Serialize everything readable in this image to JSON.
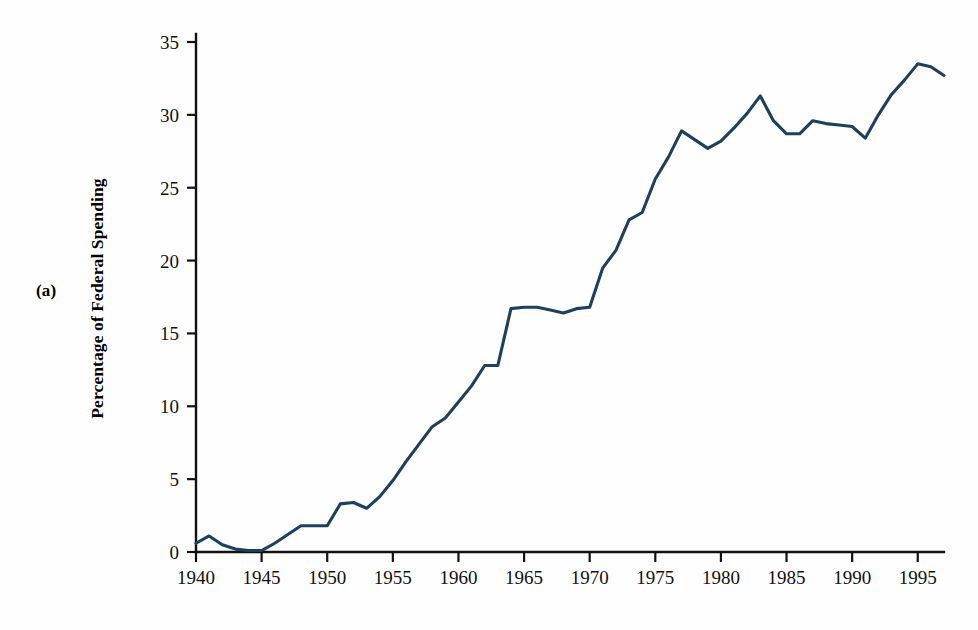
{
  "figure": {
    "panel_label": "(a)",
    "ylabel": "Percentage of Federal Spending",
    "line_color": "#1d4061",
    "axis_color": "#111111",
    "background": "#fefefe"
  },
  "chart_data": {
    "type": "line",
    "title": "",
    "subtitle": "",
    "xlabel": "",
    "ylabel": "Percentage of Federal Spending",
    "xlim": [
      1940,
      1997
    ],
    "ylim": [
      0,
      35
    ],
    "xticks": [
      1940,
      1945,
      1950,
      1955,
      1960,
      1965,
      1970,
      1975,
      1980,
      1985,
      1990,
      1995
    ],
    "xtick_labels": [
      "1940",
      "1945",
      "1950",
      "1955",
      "1960",
      "1965",
      "1970",
      "1975",
      "1980",
      "1985",
      "1990",
      "1995"
    ],
    "yticks": [
      0,
      5,
      10,
      15,
      20,
      25,
      30,
      35
    ],
    "ytick_labels": [
      "0",
      "5",
      "10",
      "15",
      "20",
      "25",
      "30",
      "35"
    ],
    "grid": false,
    "legend": null,
    "legend_position": "none",
    "annotations": [
      "(a)"
    ],
    "x": [
      1940,
      1941,
      1942,
      1943,
      1944,
      1945,
      1946,
      1947,
      1948,
      1949,
      1950,
      1951,
      1952,
      1953,
      1954,
      1955,
      1956,
      1957,
      1958,
      1959,
      1960,
      1961,
      1962,
      1963,
      1964,
      1965,
      1966,
      1967,
      1968,
      1969,
      1970,
      1971,
      1972,
      1973,
      1974,
      1975,
      1976,
      1977,
      1978,
      1979,
      1980,
      1981,
      1982,
      1983,
      1984,
      1985,
      1986,
      1987,
      1988,
      1989,
      1990,
      1991,
      1992,
      1993,
      1994,
      1995,
      1996,
      1997
    ],
    "y": [
      0.6,
      1.1,
      0.5,
      0.2,
      0.1,
      0.1,
      0.6,
      1.2,
      1.8,
      1.8,
      1.8,
      3.3,
      3.4,
      3.0,
      3.8,
      4.9,
      6.2,
      7.4,
      8.6,
      9.2,
      10.3,
      11.4,
      12.8,
      12.8,
      16.7,
      16.8,
      16.8,
      16.6,
      16.4,
      16.7,
      16.8,
      19.5,
      20.7,
      22.8,
      23.3,
      25.6,
      27.1,
      28.9,
      28.3,
      27.7,
      28.2,
      29.1,
      30.1,
      31.3,
      29.6,
      28.7,
      28.7,
      29.6,
      29.4,
      29.3,
      29.2,
      28.4,
      30.0,
      31.4,
      32.4,
      33.5,
      33.3,
      32.7
    ],
    "series": [
      {
        "name": "Percentage of Federal Spending",
        "color": "#1d4061",
        "values": [
          0.6,
          1.1,
          0.5,
          0.2,
          0.1,
          0.1,
          0.6,
          1.2,
          1.8,
          1.8,
          1.8,
          3.3,
          3.4,
          3.0,
          3.8,
          4.9,
          6.2,
          7.4,
          8.6,
          9.2,
          10.3,
          11.4,
          12.8,
          12.8,
          16.7,
          16.8,
          16.8,
          16.6,
          16.4,
          16.7,
          16.8,
          19.5,
          20.7,
          22.8,
          23.3,
          25.6,
          27.1,
          28.9,
          28.3,
          27.7,
          28.2,
          29.1,
          30.1,
          31.3,
          29.6,
          28.7,
          28.7,
          29.6,
          29.4,
          29.3,
          29.2,
          28.4,
          30.0,
          31.4,
          32.4,
          33.5,
          33.3,
          32.7
        ]
      }
    ]
  }
}
